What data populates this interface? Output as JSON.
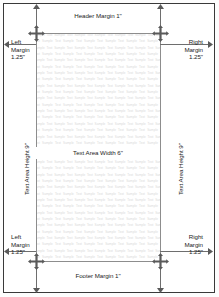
{
  "page": {
    "background_color": "#ffffff",
    "border_color": "#3a3a3a",
    "guide_color": "#8d8d8d",
    "label_color": "#1d1d1d",
    "filler_color": "#d9d9d9"
  },
  "labels": {
    "header_margin": "Header Margin 1\"",
    "footer_margin": "Footer Margin 1\"",
    "left_margin": "Left\nMargin\n1.25\"",
    "right_margin": "Right\nMargin\n1.25\"",
    "text_area_width": "Text Area Width 6\"",
    "text_area_height": "Text Area Height 9\""
  },
  "measurements": {
    "header_margin_in": "1\"",
    "footer_margin_in": "1\"",
    "left_margin_in": "1.25\"",
    "right_margin_in": "1.25\"",
    "text_area_width_in": "6\"",
    "text_area_height_in": "9\""
  },
  "filler": {
    "word": "Sample Text ",
    "repeat": 640
  },
  "icons": {
    "corner_marker": "four-way-arrow-icon",
    "edge_marker": "arrow-head-icon"
  }
}
